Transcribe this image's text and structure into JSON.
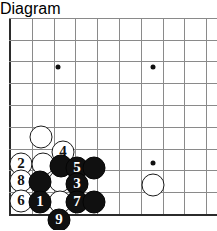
{
  "diagram": {
    "type": "go-board-diagram",
    "board": {
      "grid_spacing": 21.8,
      "origin_x": 10,
      "origin_y": 196,
      "cols": 10,
      "rows": 9,
      "line_color": "#8a8a8a",
      "edge_color": "#2b2b2b",
      "background": "#ffffff"
    },
    "star_points": [
      {
        "name": "star-point-upper-left",
        "x": 58,
        "y": 49
      },
      {
        "name": "star-point-upper-right",
        "x": 153,
        "y": 49
      },
      {
        "name": "star-point-lower-right",
        "x": 153,
        "y": 145
      }
    ],
    "stones": [
      {
        "id": "white-unnumbered-a",
        "color": "white",
        "label": "",
        "x": 41,
        "y": 119,
        "r": 11.5
      },
      {
        "id": "white-unnumbered-b",
        "color": "white",
        "label": "",
        "x": 153,
        "y": 167,
        "r": 11.5
      },
      {
        "id": "white-4",
        "color": "white",
        "label": "4",
        "x": 63,
        "y": 134,
        "r": 11.5
      },
      {
        "id": "white-2",
        "color": "white",
        "label": "2",
        "x": 21,
        "y": 146,
        "r": 11.5
      },
      {
        "id": "white-unnumbered-c",
        "color": "white",
        "label": "",
        "x": 43,
        "y": 146,
        "r": 11.5
      },
      {
        "id": "white-8",
        "color": "white",
        "label": "8",
        "x": 21,
        "y": 163,
        "r": 11.5
      },
      {
        "id": "white-unnumbered-d",
        "color": "white",
        "label": "",
        "x": 60,
        "y": 163,
        "r": 11.5
      },
      {
        "id": "white-6",
        "color": "white",
        "label": "6",
        "x": 21,
        "y": 183,
        "r": 11.5
      },
      {
        "id": "white-unnumbered-e",
        "color": "white",
        "label": "",
        "x": 60,
        "y": 184,
        "r": 11.5
      },
      {
        "id": "black-unnumbered-f",
        "color": "black",
        "label": "",
        "x": 61,
        "y": 148,
        "r": 11.5
      },
      {
        "id": "black-5",
        "color": "black",
        "label": "5",
        "x": 77,
        "y": 150,
        "r": 11.5
      },
      {
        "id": "black-unnumbered-g",
        "color": "black",
        "label": "",
        "x": 94,
        "y": 150,
        "r": 11.5
      },
      {
        "id": "black-unnumbered-h",
        "color": "black",
        "label": "",
        "x": 40,
        "y": 164,
        "r": 11.5
      },
      {
        "id": "black-3",
        "color": "black",
        "label": "3",
        "x": 77,
        "y": 166,
        "r": 11.5
      },
      {
        "id": "black-1",
        "color": "black",
        "label": "1",
        "x": 40,
        "y": 184,
        "r": 11.5
      },
      {
        "id": "black-7",
        "color": "black",
        "label": "7",
        "x": 77,
        "y": 184,
        "r": 11.5
      },
      {
        "id": "black-unnumbered-i",
        "color": "black",
        "label": "",
        "x": 94,
        "y": 184,
        "r": 11.5
      },
      {
        "id": "black-9",
        "color": "black",
        "label": "9",
        "x": 59,
        "y": 202,
        "r": 11.5
      }
    ],
    "move_numbers": [
      "1",
      "2",
      "3",
      "4",
      "5",
      "6",
      "7",
      "8",
      "9"
    ]
  }
}
